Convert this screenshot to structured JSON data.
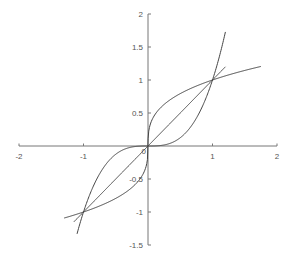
{
  "chart_data": {
    "type": "line",
    "title": "",
    "xlabel": "",
    "ylabel": "",
    "xlim": [
      -2,
      2
    ],
    "ylim": [
      -1.5,
      2
    ],
    "grid": false,
    "legend": null,
    "axes_style": "centered at origin",
    "x_ticks": [
      -2,
      -1,
      1,
      2
    ],
    "x_tick_labels": [
      "-2",
      "-1",
      "1",
      "2"
    ],
    "y_ticks": [
      -1.5,
      -1,
      -0.5,
      0.5,
      1,
      1.5,
      2
    ],
    "y_tick_labels": [
      "-1.5",
      "-1",
      "-0.5",
      "0.5",
      "1",
      "1.5",
      "2"
    ],
    "origin_label": "0",
    "series": [
      {
        "name": "y = x^3",
        "function": "x^3",
        "x_range": [
          -1.1,
          1.2
        ]
      },
      {
        "name": "y = x",
        "function": "x",
        "x_range": [
          -1.15,
          1.2
        ]
      },
      {
        "name": "y = x^(1/3)",
        "function": "cbrt(x)",
        "x_range": [
          -1.3,
          1.75
        ]
      }
    ],
    "intersections": [
      [
        -1,
        -1
      ],
      [
        0,
        0
      ],
      [
        1,
        1
      ]
    ],
    "colors": {
      "axes": "#777777",
      "curves": "#444444",
      "labels": "#555555"
    }
  }
}
